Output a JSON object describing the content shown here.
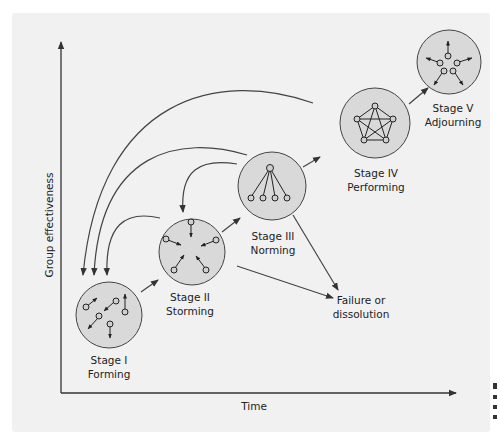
{
  "diagram": {
    "type": "team-development-stages",
    "x_axis_label": "Time",
    "y_axis_label": "Group effectiveness",
    "stages": [
      {
        "id": "stage-1",
        "line1": "Stage I",
        "line2": "Forming"
      },
      {
        "id": "stage-2",
        "line1": "Stage II",
        "line2": "Storming"
      },
      {
        "id": "stage-3",
        "line1": "Stage III",
        "line2": "Norming"
      },
      {
        "id": "stage-4",
        "line1": "Stage IV",
        "line2": "Performing"
      },
      {
        "id": "stage-5",
        "line1": "Stage V",
        "line2": "Adjourning"
      }
    ],
    "outcome": {
      "line1": "Failure or",
      "line2": "dissolution"
    },
    "flows": [
      {
        "from": "Stage I",
        "to": "Stage II",
        "kind": "forward"
      },
      {
        "from": "Stage II",
        "to": "Stage III",
        "kind": "forward"
      },
      {
        "from": "Stage III",
        "to": "Stage IV",
        "kind": "forward"
      },
      {
        "from": "Stage IV",
        "to": "Stage V",
        "kind": "forward"
      },
      {
        "from": "Stage II",
        "to": "Stage I",
        "kind": "regress"
      },
      {
        "from": "Stage III",
        "to": "Stage II",
        "kind": "regress"
      },
      {
        "from": "Stage III",
        "to": "Stage I",
        "kind": "regress"
      },
      {
        "from": "Stage IV",
        "to": "Stage I",
        "kind": "regress"
      },
      {
        "from": "Stage II",
        "to": "Failure or dissolution",
        "kind": "failure"
      },
      {
        "from": "Stage III",
        "to": "Failure or dissolution",
        "kind": "failure"
      }
    ],
    "colors": {
      "panel": "#f1f1f1",
      "circle_fill": "#d9d9d9",
      "stroke": "#333333"
    }
  }
}
